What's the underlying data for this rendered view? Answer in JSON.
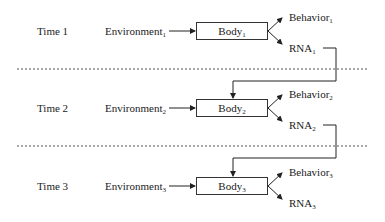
{
  "diagram": {
    "rows": [
      {
        "time": "Time 1",
        "environment": "Environment",
        "env_sub": "1",
        "body": "Body",
        "body_sub": "1",
        "behavior": "Behavior",
        "behavior_sub": "1",
        "rna": "RNA",
        "rna_sub": "1"
      },
      {
        "time": "Time 2",
        "environment": "Environment",
        "env_sub": "2",
        "body": "Body",
        "body_sub": "2",
        "behavior": "Behavior",
        "behavior_sub": "2",
        "rna": "RNA",
        "rna_sub": "2"
      },
      {
        "time": "Time 3",
        "environment": "Environment",
        "env_sub": "3",
        "body": "Body",
        "body_sub": "3",
        "behavior": "Behavior",
        "behavior_sub": "3",
        "rna": "RNA",
        "rna_sub": "3"
      }
    ],
    "colors": {
      "line": "#333333",
      "dash": "#555555",
      "background": "#ffffff"
    }
  }
}
